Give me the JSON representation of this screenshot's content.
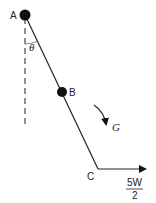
{
  "diagram": {
    "points": {
      "A": {
        "label": "A",
        "x": 25,
        "y": 15
      },
      "B": {
        "label": "B",
        "x": 62,
        "y": 92
      },
      "C": {
        "label": "C",
        "x": 98,
        "y": 169
      }
    },
    "angle_label": "θ",
    "torque_label": "G",
    "force_label": {
      "numerator": "5W",
      "denominator": "2"
    },
    "colors": {
      "line": "#222222",
      "dot": "#111111"
    }
  }
}
